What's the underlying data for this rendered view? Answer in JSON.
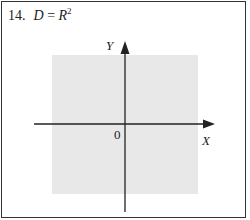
{
  "problem": {
    "number": "14.",
    "lhs": "D",
    "eq": " = ",
    "rhs_base": "R",
    "rhs_exp": "2"
  },
  "diagram": {
    "x_label": "X",
    "y_label": "Y",
    "origin_label": "0",
    "shaded_region": "entire plane R^2",
    "colors": {
      "shade": "#e8e8e8",
      "axis": "#222222",
      "frame": "#333333"
    }
  }
}
